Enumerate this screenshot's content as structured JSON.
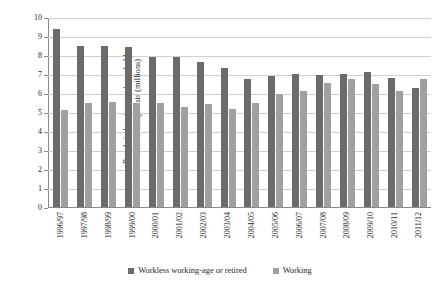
{
  "chart_data": {
    "type": "bar",
    "title": "",
    "xlabel": "",
    "ylabel": "People in low-income households after housing costs (millions)",
    "ylabel_line1": "People in low-income households",
    "ylabel_line2": "after housing costs (millions)",
    "ylim": [
      0,
      10
    ],
    "ytick_step": 1,
    "yticks": [
      0,
      1,
      2,
      3,
      4,
      5,
      6,
      7,
      8,
      9,
      10
    ],
    "ytick_labels": [
      "0",
      "1",
      "2",
      "3",
      "4",
      "5",
      "6",
      "7",
      "8",
      "9",
      "10"
    ],
    "grid": true,
    "grid_axis": "y",
    "legend_position": "bottom",
    "categories": [
      "1996/97",
      "1997/98",
      "1998/99",
      "1999/00",
      "2000/01",
      "2001/02",
      "2002/03",
      "2003/04",
      "2004/05",
      "2005/06",
      "2006/07",
      "2007/08",
      "2008/09",
      "2009/10",
      "2010/11",
      "2011/12"
    ],
    "series": [
      {
        "name": "Workless working-age or retired",
        "color": "#6b6b6b",
        "values": [
          9.35,
          8.5,
          8.5,
          8.4,
          7.9,
          7.9,
          7.65,
          7.3,
          6.75,
          6.9,
          7.0,
          6.95,
          7.0,
          7.1,
          6.8,
          6.25
        ]
      },
      {
        "name": "Working",
        "color": "#a0a0a0",
        "values": [
          5.1,
          5.5,
          5.55,
          5.5,
          5.5,
          5.25,
          5.4,
          5.15,
          5.45,
          5.95,
          6.1,
          6.55,
          6.75,
          6.45,
          6.1,
          6.75
        ]
      }
    ]
  },
  "legend": {
    "items": [
      {
        "label": "Workless working-age or retired",
        "color": "#6b6b6b"
      },
      {
        "label": "Working",
        "color": "#a0a0a0"
      }
    ]
  },
  "colors": {
    "workless": "#6b6b6b",
    "working": "#a0a0a0",
    "grid": "#cfcfcf",
    "axis": "#8a8a8a",
    "background": "#ffffff",
    "text": "#262626"
  }
}
